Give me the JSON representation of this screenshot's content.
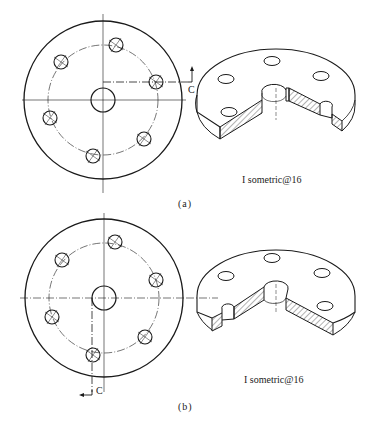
{
  "figure": {
    "panels": [
      {
        "id": "a",
        "caption": "(a)",
        "top_view": {
          "center": [
            103,
            100
          ],
          "outer_radius": 79,
          "bolt_circle_radius": 55,
          "center_hole_radius": 12,
          "bolt_hole_radius": 7,
          "bolt_holes": [
            [
              116,
              45
            ],
            [
              61,
              62
            ],
            [
              156,
              82
            ],
            [
              50,
              118
            ],
            [
              144,
              139
            ],
            [
              93,
              156
            ]
          ],
          "section_label": "C",
          "section_arrow_direction": "up"
        },
        "isometric_view": {
          "label": "I sometric@16",
          "cut": "wedge cut through bolt hole at right"
        }
      },
      {
        "id": "b",
        "caption": "(b)",
        "top_view": {
          "center": [
            104,
            298
          ],
          "outer_radius": 79,
          "bolt_circle_radius": 55,
          "center_hole_radius": 12,
          "bolt_hole_radius": 7,
          "bolt_holes": [
            [
              115,
              242
            ],
            [
              62,
              260
            ],
            [
              156,
              280
            ],
            [
              52,
              317
            ],
            [
              145,
              337
            ],
            [
              93,
              355
            ]
          ],
          "section_label": "C",
          "section_arrow_direction": "left"
        },
        "isometric_view": {
          "label": "I sometric@16",
          "cut": "wedge cut through bolt hole at left"
        }
      }
    ]
  },
  "colors": {
    "line": "#1a1a1a",
    "background": "#ffffff"
  }
}
